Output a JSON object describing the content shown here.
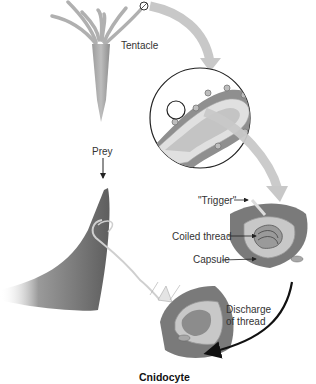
{
  "diagram": {
    "title": "Cnidocyte",
    "labels": {
      "tentacle": "Tentacle",
      "prey": "Prey",
      "trigger": "\"Trigger\"",
      "coiled_thread": "Coiled thread",
      "capsule": "Capsule",
      "discharge_line1": "Discharge",
      "discharge_line2": "of thread"
    },
    "colors": {
      "organism": "#a8a8a8",
      "tissue_outer": "#8f8f8f",
      "tissue_inner": "#d8d8d8",
      "arrow_light": "#c8c8c8",
      "arrow_dark": "#111111",
      "prey": "#6e6e6e",
      "cell_body": "#7d7d7d",
      "text": "#333333"
    }
  }
}
